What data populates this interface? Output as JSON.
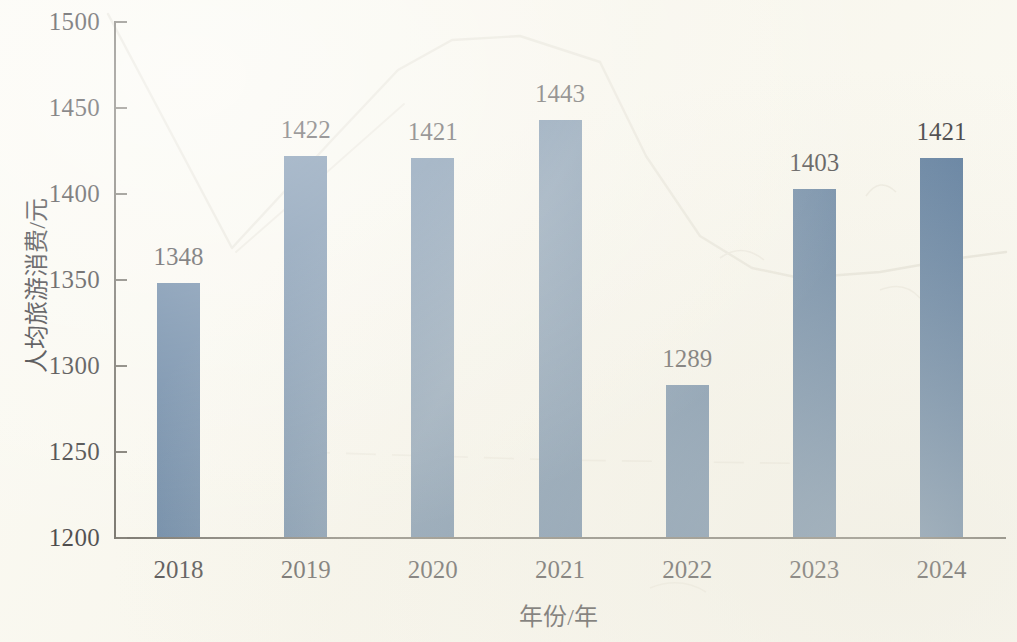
{
  "chart_data": {
    "type": "bar",
    "title": "",
    "subtitle": "",
    "xlabel": "年份/年",
    "ylabel": "人均旅游消费/元",
    "categories": [
      "2018",
      "2019",
      "2020",
      "2021",
      "2022",
      "2023",
      "2024"
    ],
    "values": [
      1348,
      1422,
      1421,
      1443,
      1289,
      1403,
      1421
    ],
    "series": [
      {
        "name": "人均旅游消费",
        "values": [
          1348,
          1422,
          1421,
          1443,
          1289,
          1403,
          1421
        ]
      }
    ],
    "data_labels": [
      "1348",
      "1422",
      "1421",
      "1443",
      "1289",
      "1403",
      "1421"
    ],
    "ylim": [
      1200,
      1500
    ],
    "ytick_labels": [
      "1500",
      "1450",
      "1400",
      "1350",
      "1300",
      "1250",
      "1200"
    ],
    "ytick_values": [
      1500,
      1450,
      1400,
      1350,
      1300,
      1250,
      1200
    ],
    "ytick_step": 50,
    "xtick_labels": [
      "2018",
      "2019",
      "2020",
      "2021",
      "2022",
      "2023",
      "2024"
    ],
    "grid": false,
    "legend": null,
    "legend_position": "none",
    "bar_color": "#3b628e",
    "axis_color": "#4e4b44",
    "text_color": "#15141a",
    "background_color": "#fbfaf3",
    "annotations": []
  }
}
